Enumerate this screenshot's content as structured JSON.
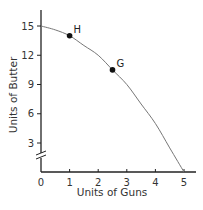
{
  "chart_data": {
    "type": "line",
    "title": "",
    "xlabel": "Units of Guns",
    "ylabel": "Units of Butter",
    "xlim": [
      0,
      5
    ],
    "ylim": [
      0,
      16
    ],
    "x_ticks": [
      "0",
      "1",
      "2",
      "3",
      "4",
      "5"
    ],
    "y_ticks": [
      "3",
      "6",
      "9",
      "12",
      "15"
    ],
    "y_axis_break": true,
    "grid": false,
    "legend": null,
    "series": [
      {
        "name": "Production possibilities frontier",
        "x": [
          0,
          0.5,
          1,
          1.5,
          2,
          2.5,
          3,
          3.5,
          4,
          4.5,
          5
        ],
        "y": [
          15,
          14.6,
          14,
          13,
          12,
          10.5,
          9,
          7,
          5,
          2.5,
          0
        ]
      }
    ],
    "points": [
      {
        "label": "H",
        "x": 1,
        "y": 14
      },
      {
        "label": "G",
        "x": 2.5,
        "y": 10.5
      }
    ],
    "colors": {
      "axis": "#222222",
      "curve": "#777777",
      "point": "#111111"
    }
  }
}
